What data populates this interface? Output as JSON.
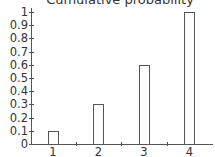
{
  "chart_data": {
    "type": "bar",
    "title": "Cumulative probability",
    "xlabel": "",
    "ylabel": "",
    "categories": [
      "1",
      "2",
      "3",
      "4"
    ],
    "values": [
      0.1,
      0.3,
      0.6,
      1.0
    ],
    "ylim": [
      0,
      1
    ],
    "yticks": [
      "0",
      "0.1",
      "0.2",
      "0.3",
      "0.4",
      "0.5",
      "0.6",
      "0.7",
      "0.8",
      "0.9",
      "1"
    ],
    "grid": false,
    "legend": null,
    "bar_fill": "#ffffff",
    "bar_edge": "#555555"
  }
}
